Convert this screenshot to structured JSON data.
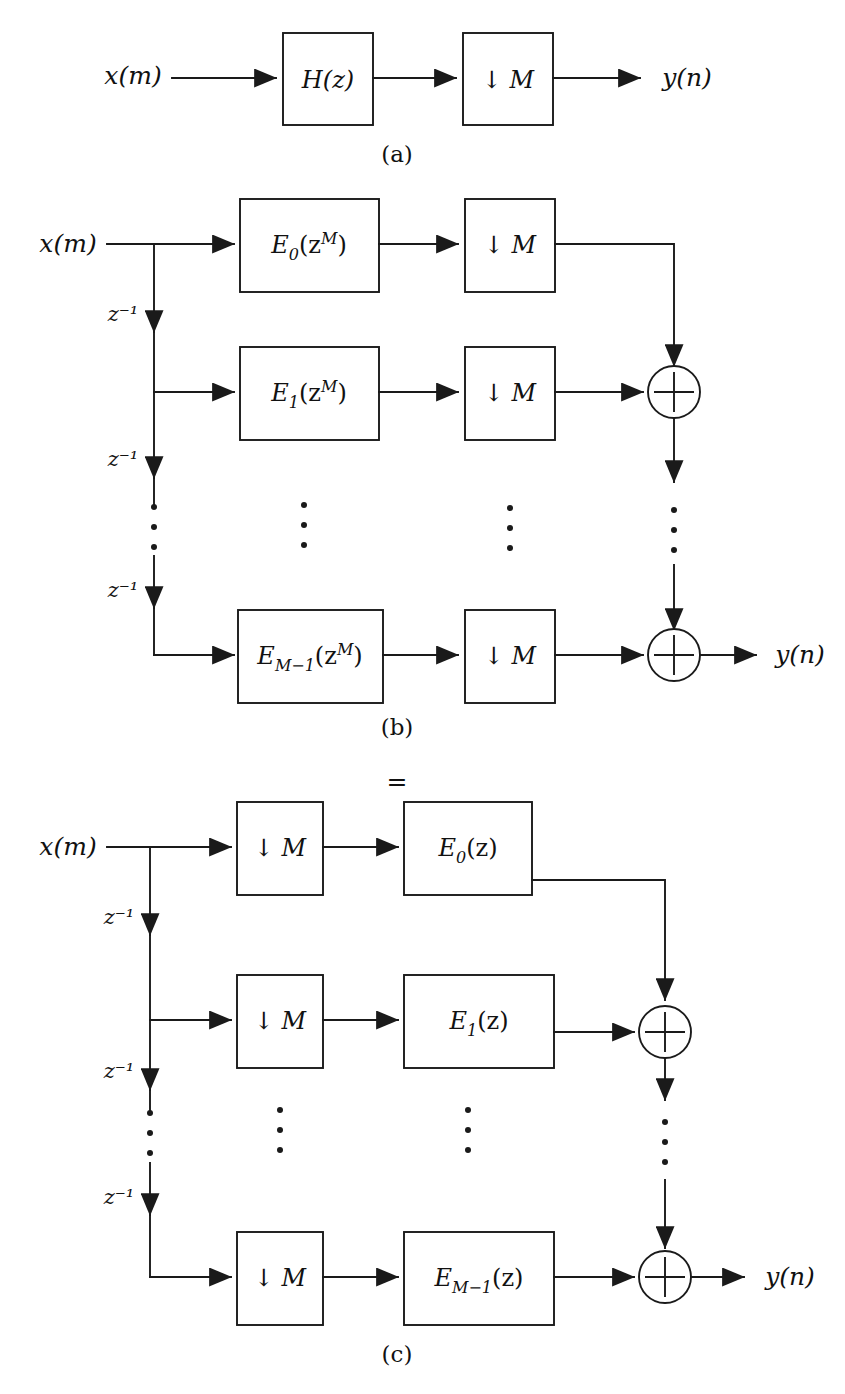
{
  "figure": {
    "kind": "signal-flow-block-diagram",
    "topic": "Polyphase decomposition and noble identity for decimation filter",
    "ink_color": "#1a1a1a",
    "background": "#ffffff"
  },
  "signals": {
    "input": "x(m)",
    "output": "y(n)",
    "delay": "z",
    "delay_exponent": "−1"
  },
  "icons": {
    "arrowhead": "arrowhead-icon",
    "vertical_dots": "vertical-ellipsis-icon",
    "adder": "summation-circle-icon",
    "downsample": "downsample-arrow-icon"
  },
  "equality": {
    "symbol": "="
  },
  "panels": [
    {
      "id": "a",
      "caption": "(a)",
      "input_label": "x(m)",
      "output_label": "y(n)",
      "blocks": [
        {
          "name": "filter-block",
          "label": "H(z)",
          "base": "H(z)"
        },
        {
          "name": "decimator-block",
          "label": "↓ M",
          "base": "↓ M"
        }
      ]
    },
    {
      "id": "b",
      "caption": "(b)",
      "input_label": "x(m)",
      "output_label": "y(n)",
      "delay_labels": [
        "z⁻¹",
        "z⁻¹",
        "z⁻¹"
      ],
      "branches": [
        {
          "index": 0,
          "polyphase": {
            "base": "E",
            "sub": "0",
            "arg": "(z",
            "sup": "M",
            "close": ")",
            "label": "E0(zM)"
          },
          "decimator": "↓ M"
        },
        {
          "index": 1,
          "polyphase": {
            "base": "E",
            "sub": "1",
            "arg": "(z",
            "sup": "M",
            "close": ")",
            "label": "E1(zM)"
          },
          "decimator": "↓ M"
        },
        {
          "index": 2,
          "polyphase": {
            "base": "E",
            "sub": "M−1",
            "arg": "(z",
            "sup": "M",
            "close": ")",
            "label": "EM-1(zM)"
          },
          "decimator": "↓ M"
        }
      ],
      "adders": 2
    },
    {
      "id": "c",
      "caption": "(c)",
      "input_label": "x(m)",
      "output_label": "y(n)",
      "delay_labels": [
        "z⁻¹",
        "z⁻¹",
        "z⁻¹"
      ],
      "branches": [
        {
          "index": 0,
          "decimator": "↓ M",
          "polyphase": {
            "base": "E",
            "sub": "0",
            "arg": "(z",
            "sup": "",
            "close": ")",
            "label": "E0(z)"
          }
        },
        {
          "index": 1,
          "decimator": "↓ M",
          "polyphase": {
            "base": "E",
            "sub": "1",
            "arg": "(z",
            "sup": "",
            "close": ")",
            "label": "E1(z)"
          }
        },
        {
          "index": 2,
          "decimator": "↓ M",
          "polyphase": {
            "base": "E",
            "sub": "M−1",
            "arg": "(z",
            "sup": "",
            "close": ")",
            "label": "EM-1(z)"
          }
        }
      ],
      "adders": 2
    }
  ]
}
